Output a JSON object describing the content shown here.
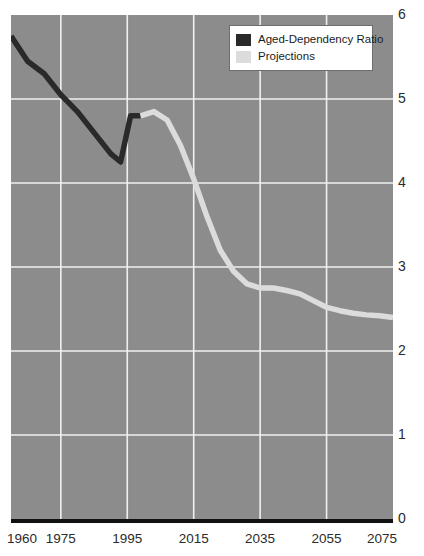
{
  "chart_data": {
    "type": "line",
    "title": "",
    "subtitle": "",
    "xlabel": "",
    "ylabel": "",
    "xlim": [
      1960,
      2075
    ],
    "ylim": [
      0,
      6
    ],
    "grid": true,
    "grid_color": "#f0f0f0",
    "background_color": "#8c8c8c",
    "legend_position": "top-right",
    "x_ticks": [
      1960,
      1975,
      1995,
      2015,
      2035,
      2055,
      2075
    ],
    "x_tick_labels": [
      "1960",
      "1975",
      "1995",
      "2015",
      "2035",
      "2055",
      "2075"
    ],
    "y_ticks": [
      0,
      1,
      2,
      3,
      4,
      5,
      6
    ],
    "y_tick_labels": [
      "0",
      "1",
      "2",
      "3",
      "4",
      "5",
      "6"
    ],
    "series": [
      {
        "name": "Aged-Dependency Ratio",
        "color": "#2a2a2a",
        "x": [
          1960,
          1965,
          1970,
          1975,
          1980,
          1985,
          1990,
          1993,
          1996,
          1999
        ],
        "values": [
          5.75,
          5.45,
          5.3,
          5.05,
          4.85,
          4.6,
          4.35,
          4.25,
          4.8,
          4.8
        ]
      },
      {
        "name": "Projections",
        "color": "#dcdcdc",
        "x": [
          1999,
          2003,
          2007,
          2011,
          2015,
          2019,
          2023,
          2027,
          2031,
          2035,
          2039,
          2043,
          2047,
          2051,
          2055,
          2059,
          2063,
          2067,
          2071,
          2075
        ],
        "values": [
          4.8,
          4.85,
          4.75,
          4.45,
          4.05,
          3.6,
          3.2,
          2.95,
          2.8,
          2.75,
          2.75,
          2.72,
          2.68,
          2.6,
          2.52,
          2.48,
          2.45,
          2.43,
          2.42,
          2.4
        ]
      }
    ]
  },
  "legend": {
    "items": [
      {
        "label": "Aged-Dependency Ratio",
        "color": "#2a2a2a"
      },
      {
        "label": "Projections",
        "color": "#dcdcdc"
      }
    ]
  }
}
